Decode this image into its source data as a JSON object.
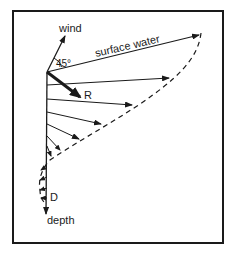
{
  "diagram": {
    "labels": {
      "wind": "wind",
      "angle": "45°",
      "surface": "surface water",
      "resultant": "R",
      "ekman_depth": "D",
      "depth": "depth"
    },
    "colors": {
      "ink": "#1a1a1a",
      "background": "#ffffff"
    }
  }
}
